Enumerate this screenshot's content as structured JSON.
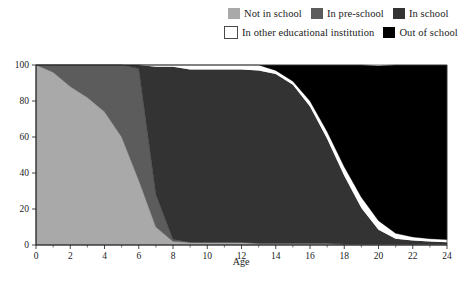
{
  "legend": {
    "rows": [
      [
        {
          "label": "Not in school",
          "color": "#a9a9a9",
          "border": "#9a9a9a"
        },
        {
          "label": "In pre-school",
          "color": "#5c5c5c",
          "border": "#5c5c5c"
        },
        {
          "label": "In school",
          "color": "#333333",
          "border": "#333333"
        }
      ],
      [
        {
          "label": "In other educational institution",
          "color": "#ffffff",
          "border": "#4a4a4a"
        },
        {
          "label": "Out of school",
          "color": "#000000",
          "border": "#000000"
        }
      ]
    ]
  },
  "axes": {
    "x_title": "Age",
    "x_ticks": [
      "0",
      "2",
      "4",
      "6",
      "8",
      "10",
      "12",
      "14",
      "16",
      "18",
      "20",
      "22",
      "24"
    ],
    "y_ticks": [
      "0",
      "20",
      "40",
      "60",
      "80",
      "100"
    ],
    "x_min": 0,
    "x_max": 24,
    "y_min": 0,
    "y_max": 100
  },
  "chart_data": {
    "type": "area",
    "stacked": true,
    "title": "",
    "xlabel": "Age",
    "ylabel": "",
    "xlim": [
      0,
      24
    ],
    "ylim": [
      0,
      100
    ],
    "grid": false,
    "legend_position": "top-right",
    "x": [
      0,
      1,
      2,
      3,
      4,
      5,
      6,
      7,
      8,
      9,
      10,
      11,
      12,
      13,
      14,
      15,
      16,
      17,
      18,
      19,
      20,
      21,
      22,
      23,
      24
    ],
    "series": [
      {
        "name": "Not in school",
        "color": "#a9a9a9",
        "values": [
          100,
          96,
          88,
          82,
          74,
          60,
          36,
          10,
          2,
          1.5,
          1.5,
          1.5,
          1.5,
          1,
          1,
          1,
          1,
          1,
          0.5,
          0.5,
          0.5,
          0.5,
          0.5,
          0.5,
          0.5
        ]
      },
      {
        "name": "In pre-school",
        "color": "#5c5c5c",
        "values": [
          0,
          4,
          12,
          18,
          26,
          40,
          62,
          18,
          1,
          0,
          0,
          0,
          0,
          0,
          0,
          0,
          0,
          0,
          0,
          0,
          0,
          0,
          0,
          0,
          0
        ]
      },
      {
        "name": "In school",
        "color": "#333333",
        "values": [
          0,
          0,
          0,
          0,
          0,
          0,
          2,
          71,
          96,
          96,
          96,
          96,
          96,
          96,
          94,
          88,
          76,
          58,
          38,
          20,
          8,
          3,
          2,
          1.5,
          1
        ]
      },
      {
        "name": "In other educational institution",
        "color": "#ffffff",
        "values": [
          0,
          0,
          0,
          0,
          0,
          0,
          0,
          1,
          1,
          2.5,
          2.5,
          2.5,
          2.5,
          3,
          2,
          2,
          3,
          4,
          5,
          6,
          5,
          3,
          2,
          1.5,
          1.5
        ]
      },
      {
        "name": "Out of school",
        "color": "#000000",
        "values": [
          0,
          0,
          0,
          0,
          0,
          0,
          0,
          0,
          0,
          0,
          0,
          0,
          0,
          0,
          3,
          9,
          20,
          37,
          56.5,
          73.5,
          86,
          93.5,
          95.5,
          96.5,
          97
        ]
      }
    ]
  }
}
